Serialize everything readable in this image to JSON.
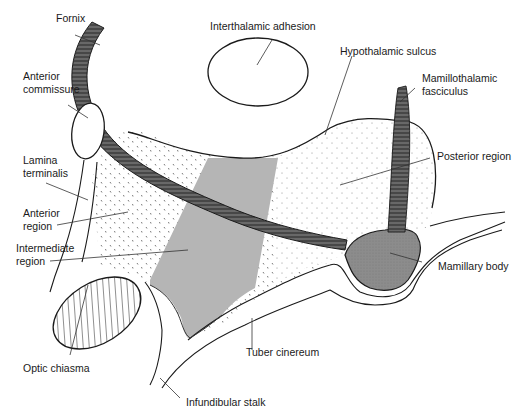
{
  "diagram": {
    "colors": {
      "outline": "#1a1a1a",
      "fiber_tract": "#4a4a4a",
      "tuberal_shading": "#b5b5b5",
      "mamillary_body": "#8a8a8a",
      "background": "#ffffff",
      "stipple": "#555555"
    },
    "labels": {
      "fornix": "Fornix",
      "interthalamic_adhesion": "Interthalamic adhesion",
      "hypothalamic_sulcus": "Hypothalamic sulcus",
      "mamillothalamic_1": "Mamillothalamic",
      "mamillothalamic_2": "fasciculus",
      "anterior_commissure_1": "Anterior",
      "anterior_commissure_2": "commissure",
      "posterior_region": "Posterior region",
      "lamina_terminalis_1": "Lamina",
      "lamina_terminalis_2": "terminalis",
      "anterior_region_1": "Anterior",
      "anterior_region_2": "region",
      "intermediate_region_1": "Intermediate",
      "intermediate_region_2": "region",
      "mamillary_body": "Mamillary body",
      "tuber_cinereum": "Tuber cinereum",
      "optic_chiasma": "Optic chiasma",
      "infundibular_stalk": "Infundibular stalk"
    }
  }
}
